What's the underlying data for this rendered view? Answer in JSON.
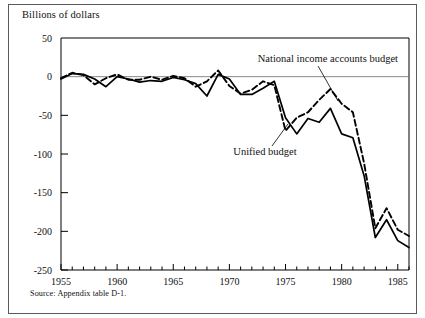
{
  "figure": {
    "axis_title": "Billions of dollars",
    "source_note": "Source:  Appendix table D-1."
  },
  "annotations": {
    "nia_label": "National income accounts budget",
    "unified_label": "Unified budget"
  },
  "axes": {
    "y_ticks": [
      "50",
      "0",
      "-50",
      "-100",
      "-150",
      "-200",
      "-250"
    ],
    "x_ticks": [
      "1955",
      "1960",
      "1965",
      "1970",
      "1975",
      "1980",
      "1985"
    ]
  },
  "chart_data": {
    "type": "line",
    "title": "",
    "subtitle": "",
    "xlabel": "",
    "ylabel": "Billions of dollars",
    "xlim": [
      1955,
      1986
    ],
    "ylim": [
      -250,
      50
    ],
    "grid": false,
    "legend": "inline-annotations",
    "x": [
      1955,
      1956,
      1957,
      1958,
      1959,
      1960,
      1961,
      1962,
      1963,
      1964,
      1965,
      1966,
      1967,
      1968,
      1969,
      1970,
      1971,
      1972,
      1973,
      1974,
      1975,
      1976,
      1977,
      1978,
      1979,
      1980,
      1981,
      1982,
      1983,
      1984,
      1985,
      1986
    ],
    "series": [
      {
        "name": "Unified budget",
        "style": "solid",
        "color": "#000000",
        "values": [
          -3,
          4,
          3,
          -3,
          -13,
          0,
          -3,
          -7,
          -5,
          -6,
          -1,
          -4,
          -9,
          -25,
          3,
          -3,
          -23,
          -23,
          -15,
          -6,
          -53,
          -74,
          -54,
          -59,
          -41,
          -74,
          -79,
          -128,
          -208,
          -185,
          -212,
          -221
        ]
      },
      {
        "name": "National income accounts budget",
        "style": "dashed",
        "color": "#000000",
        "values": [
          -2,
          5,
          2,
          -10,
          -2,
          3,
          -4,
          -4,
          0,
          -4,
          1,
          -2,
          -13,
          -6,
          8,
          -12,
          -22,
          -17,
          -6,
          -11,
          -70,
          -53,
          -46,
          -30,
          -16,
          -35,
          -46,
          -112,
          -196,
          -170,
          -198,
          -206
        ]
      }
    ]
  }
}
